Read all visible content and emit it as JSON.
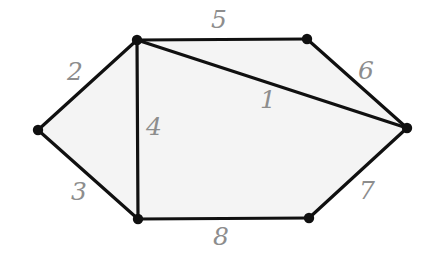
{
  "figure": {
    "background_color": "#ffffff",
    "face_fill_color": "#f4f4f4",
    "edge_color": "#101010",
    "vertex_color": "#101010",
    "label_color": "#8d8d8d",
    "edge_stroke_width": 3.2,
    "vertex_radius": 5.2,
    "width": 431,
    "height": 258
  },
  "vertices": [
    {
      "id": "v-left",
      "name": "left-vertex",
      "x": 38,
      "y": 130
    },
    {
      "id": "v-top-left",
      "name": "top-left-vertex",
      "x": 137,
      "y": 40
    },
    {
      "id": "v-top-right",
      "name": "top-right-vertex",
      "x": 307,
      "y": 39
    },
    {
      "id": "v-right",
      "name": "right-vertex",
      "x": 407,
      "y": 128
    },
    {
      "id": "v-bottom-right",
      "name": "bottom-right-vertex",
      "x": 309,
      "y": 218
    },
    {
      "id": "v-bottom-left",
      "name": "bottom-left-vertex",
      "x": 138,
      "y": 219
    }
  ],
  "edges": [
    {
      "id": "e1",
      "label": "1",
      "from": "v-top-left",
      "to": "v-right",
      "x1": 137,
      "y1": 40,
      "x2": 407,
      "y2": 128,
      "label_x": 268,
      "label_y": 101
    },
    {
      "id": "e2",
      "label": "2",
      "from": "v-left",
      "to": "v-top-left",
      "x1": 38,
      "y1": 130,
      "x2": 137,
      "y2": 40,
      "label_x": 75,
      "label_y": 73
    },
    {
      "id": "e3",
      "label": "3",
      "from": "v-left",
      "to": "v-bottom-left",
      "x1": 38,
      "y1": 130,
      "x2": 138,
      "y2": 219,
      "label_x": 79,
      "label_y": 193
    },
    {
      "id": "e4",
      "label": "4",
      "from": "v-top-left",
      "to": "v-bottom-left",
      "x1": 137,
      "y1": 40,
      "x2": 138,
      "y2": 219,
      "label_x": 154,
      "label_y": 128
    },
    {
      "id": "e5",
      "label": "5",
      "from": "v-top-left",
      "to": "v-top-right",
      "x1": 137,
      "y1": 40,
      "x2": 307,
      "y2": 39,
      "label_x": 219,
      "label_y": 21
    },
    {
      "id": "e6",
      "label": "6",
      "from": "v-top-right",
      "to": "v-right",
      "x1": 307,
      "y1": 39,
      "x2": 407,
      "y2": 128,
      "label_x": 366,
      "label_y": 72
    },
    {
      "id": "e7",
      "label": "7",
      "from": "v-bottom-right",
      "to": "v-right",
      "x1": 309,
      "y1": 218,
      "x2": 407,
      "y2": 128,
      "label_x": 367,
      "label_y": 192
    },
    {
      "id": "e8",
      "label": "8",
      "from": "v-bottom-left",
      "to": "v-bottom-right",
      "x1": 138,
      "y1": 219,
      "x2": 309,
      "y2": 218,
      "label_x": 221,
      "label_y": 238
    }
  ],
  "faces": [
    {
      "id": "f-outer-polygon",
      "name": "hexagon-region",
      "points": "38,130 137,40 307,39 407,128 309,218 138,219"
    }
  ]
}
